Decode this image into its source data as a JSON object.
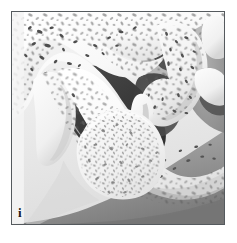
{
  "figure": {
    "panel_label": "i",
    "caption_alt": "Grayscale anatomical cross-section of the maxillary sinus region showing trabecular bone, a dark air-filled sinus cavity, a downward bony septum, and a granular bone-graft mass filling the inferior recess.",
    "frame": {
      "border_color": "#555a5e",
      "border_width_px": 1,
      "inset_px": 11
    },
    "palette": {
      "page_background": "#ffffff",
      "cortical_bone_white": "#fbfbfb",
      "cortical_bone_shadow": "#d8d8d8",
      "trabecular_void_dark": "#4a4a4a",
      "sinus_cavity_dark": "#3c3c3c",
      "sinus_cavity_darkest": "#2f2f2f",
      "soft_tissue_mid_gray": "#9a9a9a",
      "background_light_gray": "#efefef",
      "background_deep_gray": "#7d7d7d",
      "graft_mass_fill": "#f2f2f2",
      "graft_speckle": "#7e7e7e",
      "label_text": "#1a1a1a"
    },
    "regions": [
      {
        "name": "superior-trabecular-bone",
        "tone": "light-with-dark-marrow-voids"
      },
      {
        "name": "sinus-air-cavity",
        "tone": "dark-gray"
      },
      {
        "name": "bony-septum",
        "tone": "light-cortical-outline"
      },
      {
        "name": "granular-graft-mass",
        "tone": "speckled-light"
      },
      {
        "name": "lateral-hooked-bone",
        "tone": "light-with-dark-marrow-voids"
      },
      {
        "name": "inferior-alveolar-bone",
        "tone": "light-cortical-band"
      },
      {
        "name": "background-soft-tissue",
        "tone": "gradient-gray"
      }
    ]
  }
}
